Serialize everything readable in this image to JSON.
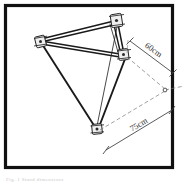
{
  "figure": {
    "kind": "technical-line-drawing",
    "border_color": "#111111",
    "background_color": "#ffffff",
    "line_color": "#1a1a1a",
    "dimension_line_color": "#555555",
    "caption_text": "Fig. 1 Stand dimensions"
  },
  "dimensions": [
    {
      "id": "dim-upper",
      "label": "60cm",
      "orientation": "diagonal-down-right"
    },
    {
      "id": "dim-lower",
      "label": "75cm",
      "orientation": "diagonal-up-right"
    }
  ],
  "joints": [
    {
      "id": "joint-left",
      "label": "left pivot clamp"
    },
    {
      "id": "joint-top-right",
      "label": "top pivot clamp"
    },
    {
      "id": "joint-mid-right",
      "label": "middle pivot clamp"
    },
    {
      "id": "joint-bottom",
      "label": "foot pivot clamp"
    }
  ],
  "nodes": [
    {
      "id": "vanishing-node",
      "label": "dimension origin node"
    }
  ]
}
